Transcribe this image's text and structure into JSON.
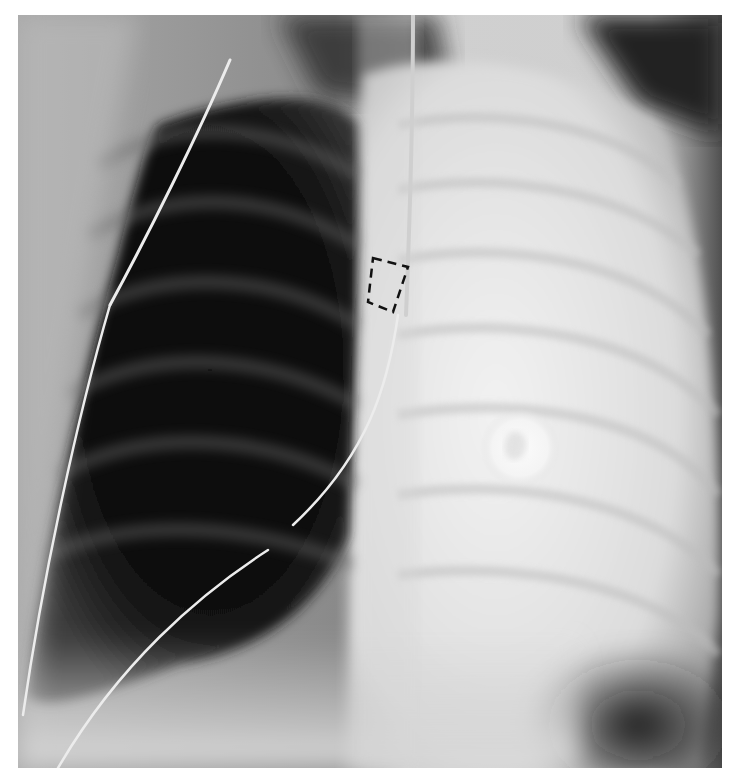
{
  "image": {
    "kind": "chest-radiograph",
    "view": "frontal",
    "background": "#ffffff",
    "frame": {
      "x": 18,
      "y": 15,
      "width": 704,
      "height": 753
    }
  },
  "annotations": [
    {
      "type": "dashed-rectangle",
      "description": "dashed box marking region near mediastinum",
      "points": [
        [
          373,
          258
        ],
        [
          408,
          267
        ],
        [
          393,
          312
        ],
        [
          368,
          302
        ]
      ],
      "color": "#111111"
    }
  ],
  "features": {
    "left_hemithorax": "dark aerated lung with ribs",
    "right_hemithorax": "diffuse opacification (whiteout)",
    "round_density": {
      "cx": 520,
      "cy": 448,
      "r": 38
    },
    "tubes_lines": 4
  },
  "colors": {
    "lung_dark": "#0c0c0c",
    "opacity_light": "#e6e6e6",
    "tube": "#e8e8e8"
  }
}
